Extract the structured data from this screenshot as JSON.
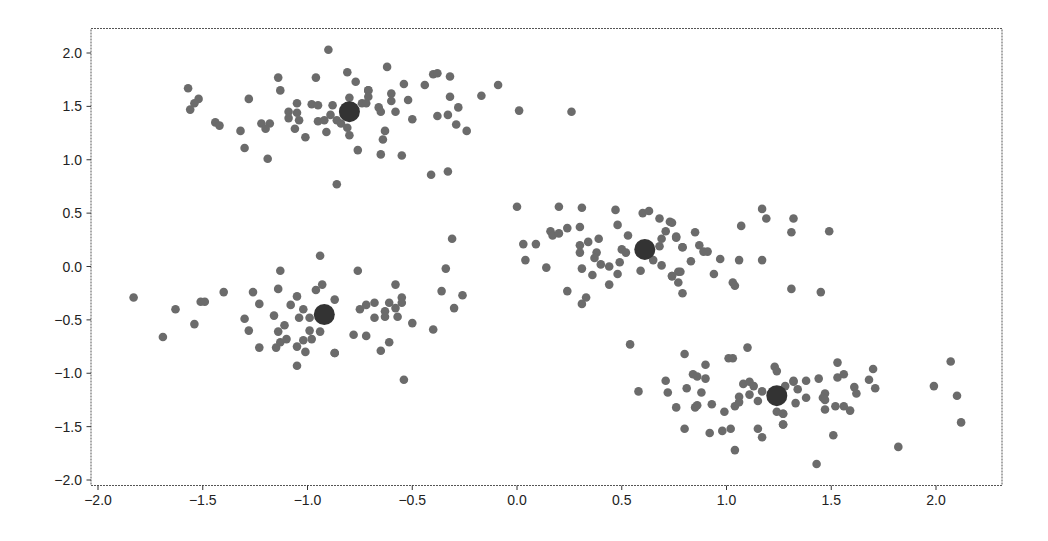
{
  "chart_data": {
    "type": "scatter",
    "title": "",
    "xlabel": "",
    "ylabel": "",
    "xlim": [
      -2.2,
      2.35
    ],
    "ylim": [
      -2.05,
      2.3
    ],
    "grid": false,
    "legend": null,
    "x_ticks": [
      -2.0,
      -1.5,
      -1.0,
      -0.5,
      0.0,
      0.5,
      1.0,
      1.5,
      2.0
    ],
    "x_tick_labels": [
      "−2.0",
      "−1.5",
      "−1.0",
      "−0.5",
      "0.0",
      "0.5",
      "1.0",
      "1.5",
      "2.0"
    ],
    "y_ticks": [
      2.0,
      1.5,
      1.0,
      0.5,
      0.0,
      -0.5,
      -1.0,
      -1.5,
      -2.0
    ],
    "y_tick_labels": [
      "2.0",
      "1.5",
      "1.0",
      "0.5",
      "0.0",
      "−0.5",
      "−1.0",
      "−1.5",
      "−2.0"
    ],
    "colors": {
      "points": "#6b6b6b",
      "centroids": "#333333",
      "frame": "#555555",
      "text": "#222222"
    },
    "centroids": [
      {
        "x": -0.8,
        "y": 1.45
      },
      {
        "x": -0.92,
        "y": -0.45
      },
      {
        "x": 0.61,
        "y": 0.16
      },
      {
        "x": 1.24,
        "y": -1.21
      }
    ],
    "series": [
      {
        "name": "cluster-top-left",
        "points": [
          [
            -1.57,
            1.67
          ],
          [
            -1.52,
            1.57
          ],
          [
            -1.54,
            1.53
          ],
          [
            -1.56,
            1.47
          ],
          [
            -1.44,
            1.35
          ],
          [
            -1.42,
            1.32
          ],
          [
            -1.32,
            1.27
          ],
          [
            -1.3,
            1.11
          ],
          [
            -1.28,
            1.57
          ],
          [
            -1.22,
            1.34
          ],
          [
            -1.18,
            1.34
          ],
          [
            -1.2,
            1.29
          ],
          [
            -1.19,
            1.01
          ],
          [
            -1.14,
            1.77
          ],
          [
            -1.13,
            1.65
          ],
          [
            -1.09,
            1.45
          ],
          [
            -1.09,
            1.39
          ],
          [
            -1.05,
            1.53
          ],
          [
            -1.05,
            1.44
          ],
          [
            -1.04,
            1.37
          ],
          [
            -1.06,
            1.29
          ],
          [
            -1.01,
            1.21
          ],
          [
            -0.98,
            1.52
          ],
          [
            -0.95,
            1.51
          ],
          [
            -0.96,
            1.77
          ],
          [
            -0.95,
            1.36
          ],
          [
            -0.92,
            1.37
          ],
          [
            -0.91,
            1.26
          ],
          [
            -0.9,
            2.03
          ],
          [
            -0.88,
            1.51
          ],
          [
            -0.89,
            1.42
          ],
          [
            -0.86,
            1.37
          ],
          [
            -0.84,
            1.34
          ],
          [
            -0.81,
            1.82
          ],
          [
            -0.77,
            1.73
          ],
          [
            -0.8,
            1.58
          ],
          [
            -0.74,
            1.53
          ],
          [
            -0.81,
            1.3
          ],
          [
            -0.8,
            1.23
          ],
          [
            -0.76,
            1.09
          ],
          [
            -0.86,
            0.77
          ],
          [
            -0.71,
            1.65
          ],
          [
            -0.62,
            1.87
          ],
          [
            -0.71,
            1.65
          ],
          [
            -0.71,
            1.59
          ],
          [
            -0.72,
            1.53
          ],
          [
            -0.6,
            1.62
          ],
          [
            -0.6,
            1.55
          ],
          [
            -0.54,
            1.71
          ],
          [
            -0.52,
            1.56
          ],
          [
            -0.66,
            1.49
          ],
          [
            -0.65,
            1.45
          ],
          [
            -0.58,
            1.45
          ],
          [
            -0.5,
            1.38
          ],
          [
            -0.63,
            1.27
          ],
          [
            -0.64,
            1.19
          ],
          [
            -0.65,
            1.05
          ],
          [
            -0.55,
            1.04
          ],
          [
            -0.44,
            1.7
          ],
          [
            -0.4,
            1.8
          ],
          [
            -0.38,
            1.81
          ],
          [
            -0.32,
            1.78
          ],
          [
            -0.32,
            1.59
          ],
          [
            -0.28,
            1.49
          ],
          [
            -0.38,
            1.41
          ],
          [
            -0.33,
            1.42
          ],
          [
            -0.29,
            1.33
          ],
          [
            -0.24,
            1.27
          ],
          [
            -0.41,
            0.86
          ],
          [
            -0.33,
            0.89
          ],
          [
            -0.17,
            1.6
          ],
          [
            -0.09,
            1.7
          ],
          [
            0.01,
            1.46
          ],
          [
            0.26,
            1.45
          ]
        ]
      },
      {
        "name": "cluster-bottom-left",
        "points": [
          [
            -1.83,
            -0.29
          ],
          [
            -1.69,
            -0.66
          ],
          [
            -1.63,
            -0.4
          ],
          [
            -1.54,
            -0.54
          ],
          [
            -1.51,
            -0.33
          ],
          [
            -1.49,
            -0.33
          ],
          [
            -1.4,
            -0.24
          ],
          [
            -1.3,
            -0.49
          ],
          [
            -1.28,
            -0.6
          ],
          [
            -1.26,
            -0.24
          ],
          [
            -1.23,
            -0.35
          ],
          [
            -1.23,
            -0.76
          ],
          [
            -1.16,
            -0.46
          ],
          [
            -1.14,
            -0.21
          ],
          [
            -1.13,
            -0.04
          ],
          [
            -1.14,
            -0.61
          ],
          [
            -1.11,
            -0.55
          ],
          [
            -1.15,
            -0.76
          ],
          [
            -1.13,
            -0.71
          ],
          [
            -1.1,
            -0.68
          ],
          [
            -1.08,
            -0.36
          ],
          [
            -1.05,
            -0.28
          ],
          [
            -1.04,
            -0.48
          ],
          [
            -1.05,
            -0.75
          ],
          [
            -1.05,
            -0.93
          ],
          [
            -1.02,
            -0.69
          ],
          [
            -1.02,
            -0.4
          ],
          [
            -1.01,
            -0.8
          ],
          [
            -0.99,
            -0.48
          ],
          [
            -0.99,
            -0.6
          ],
          [
            -0.98,
            -0.68
          ],
          [
            -0.96,
            -0.22
          ],
          [
            -0.93,
            -0.17
          ],
          [
            -0.94,
            0.1
          ],
          [
            -0.94,
            -0.61
          ],
          [
            -0.87,
            -0.31
          ],
          [
            -0.87,
            -0.81
          ],
          [
            -0.76,
            -0.04
          ],
          [
            -0.87,
            -0.81
          ],
          [
            -0.78,
            -0.64
          ],
          [
            -0.72,
            -0.65
          ],
          [
            -0.75,
            -0.4
          ],
          [
            -0.72,
            -0.36
          ],
          [
            -0.68,
            -0.34
          ],
          [
            -0.68,
            -0.48
          ],
          [
            -0.63,
            -0.42
          ],
          [
            -0.63,
            -0.47
          ],
          [
            -0.61,
            -0.34
          ],
          [
            -0.58,
            -0.17
          ],
          [
            -0.58,
            -0.39
          ],
          [
            -0.57,
            -0.47
          ],
          [
            -0.55,
            -0.29
          ],
          [
            -0.55,
            -0.34
          ],
          [
            -0.61,
            -0.71
          ],
          [
            -0.65,
            -0.79
          ],
          [
            -0.5,
            -0.53
          ],
          [
            -0.54,
            -1.06
          ],
          [
            -0.4,
            -0.59
          ],
          [
            -0.36,
            -0.23
          ],
          [
            -0.34,
            -0.02
          ],
          [
            -0.31,
            0.26
          ],
          [
            -0.26,
            -0.27
          ],
          [
            -0.3,
            -0.39
          ]
        ]
      },
      {
        "name": "cluster-middle",
        "points": [
          [
            0.0,
            0.56
          ],
          [
            0.2,
            0.56
          ],
          [
            0.31,
            0.55
          ],
          [
            0.47,
            0.53
          ],
          [
            0.6,
            0.5
          ],
          [
            0.63,
            0.52
          ],
          [
            0.68,
            0.45
          ],
          [
            0.73,
            0.42
          ],
          [
            0.48,
            0.39
          ],
          [
            0.3,
            0.37
          ],
          [
            0.24,
            0.36
          ],
          [
            0.16,
            0.33
          ],
          [
            0.17,
            0.29
          ],
          [
            0.2,
            0.31
          ],
          [
            0.71,
            0.33
          ],
          [
            0.53,
            0.29
          ],
          [
            0.76,
            0.28
          ],
          [
            0.69,
            0.26
          ],
          [
            0.39,
            0.26
          ],
          [
            0.34,
            0.23
          ],
          [
            0.3,
            0.2
          ],
          [
            0.03,
            0.21
          ],
          [
            0.09,
            0.21
          ],
          [
            0.79,
            0.18
          ],
          [
            0.68,
            0.19
          ],
          [
            0.5,
            0.16
          ],
          [
            0.52,
            0.13
          ],
          [
            0.3,
            0.13
          ],
          [
            0.38,
            0.13
          ],
          [
            0.37,
            0.08
          ],
          [
            0.04,
            0.06
          ],
          [
            0.65,
            0.06
          ],
          [
            0.49,
            0.04
          ],
          [
            0.4,
            0.02
          ],
          [
            0.44,
            0.0
          ],
          [
            0.69,
            0.01
          ],
          [
            0.14,
            -0.01
          ],
          [
            0.31,
            -0.02
          ],
          [
            0.59,
            -0.04
          ],
          [
            0.48,
            -0.07
          ],
          [
            0.36,
            -0.08
          ],
          [
            0.77,
            -0.05
          ],
          [
            0.74,
            -0.09
          ],
          [
            0.77,
            -0.15
          ],
          [
            0.44,
            -0.17
          ],
          [
            0.79,
            -0.25
          ],
          [
            0.24,
            -0.23
          ],
          [
            0.33,
            -0.29
          ],
          [
            0.31,
            -0.35
          ],
          [
            0.74,
            0.41
          ],
          [
            0.85,
            0.32
          ],
          [
            0.76,
            0.27
          ],
          [
            0.79,
            0.18
          ],
          [
            0.87,
            0.2
          ],
          [
            0.89,
            0.14
          ],
          [
            0.91,
            0.14
          ],
          [
            0.83,
            0.05
          ],
          [
            0.97,
            0.07
          ],
          [
            1.07,
            0.38
          ],
          [
            1.17,
            0.54
          ],
          [
            1.19,
            0.45
          ],
          [
            1.06,
            0.06
          ],
          [
            1.17,
            0.06
          ],
          [
            1.32,
            0.45
          ],
          [
            1.31,
            0.32
          ],
          [
            1.49,
            0.33
          ],
          [
            0.78,
            -0.05
          ],
          [
            0.74,
            -0.09
          ],
          [
            0.94,
            -0.07
          ],
          [
            1.03,
            -0.15
          ],
          [
            1.04,
            -0.18
          ],
          [
            1.31,
            -0.21
          ],
          [
            1.45,
            -0.24
          ]
        ]
      },
      {
        "name": "cluster-bottom-right",
        "points": [
          [
            0.54,
            -0.73
          ],
          [
            0.58,
            -1.17
          ],
          [
            0.71,
            -1.07
          ],
          [
            0.72,
            -1.18
          ],
          [
            0.76,
            -1.32
          ],
          [
            0.8,
            -1.52
          ],
          [
            0.8,
            -0.82
          ],
          [
            0.81,
            -1.14
          ],
          [
            0.84,
            -1.01
          ],
          [
            0.86,
            -1.03
          ],
          [
            0.85,
            -1.32
          ],
          [
            0.86,
            -1.3
          ],
          [
            0.88,
            -1.18
          ],
          [
            0.9,
            -0.92
          ],
          [
            0.9,
            -1.05
          ],
          [
            0.92,
            -1.56
          ],
          [
            0.93,
            -1.29
          ],
          [
            0.99,
            -1.36
          ],
          [
            0.98,
            -1.54
          ],
          [
            1.02,
            -1.52
          ],
          [
            1.01,
            -0.86
          ],
          [
            1.03,
            -0.86
          ],
          [
            1.04,
            -1.72
          ],
          [
            1.04,
            -1.31
          ],
          [
            1.06,
            -1.22
          ],
          [
            1.06,
            -1.27
          ],
          [
            1.08,
            -1.1
          ],
          [
            1.11,
            -1.08
          ],
          [
            1.11,
            -1.2
          ],
          [
            1.13,
            -1.12
          ],
          [
            1.1,
            -0.76
          ],
          [
            1.15,
            -1.26
          ],
          [
            1.15,
            -1.52
          ],
          [
            1.17,
            -1.6
          ],
          [
            1.17,
            -1.17
          ],
          [
            1.23,
            -0.94
          ],
          [
            1.24,
            -0.98
          ],
          [
            1.24,
            -1.36
          ],
          [
            1.27,
            -1.38
          ],
          [
            1.27,
            -1.48
          ],
          [
            1.28,
            -1.12
          ],
          [
            1.32,
            -1.07
          ],
          [
            1.53,
            -0.9
          ],
          [
            1.32,
            -1.08
          ],
          [
            1.34,
            -1.15
          ],
          [
            1.38,
            -1.07
          ],
          [
            1.44,
            -1.05
          ],
          [
            1.33,
            -1.28
          ],
          [
            1.38,
            -1.23
          ],
          [
            1.27,
            -1.38
          ],
          [
            1.27,
            -1.48
          ],
          [
            1.53,
            -1.04
          ],
          [
            1.56,
            -1.01
          ],
          [
            1.7,
            -0.96
          ],
          [
            1.68,
            -1.06
          ],
          [
            1.71,
            -1.14
          ],
          [
            1.61,
            -1.13
          ],
          [
            1.62,
            -1.19
          ],
          [
            1.47,
            -1.19
          ],
          [
            1.46,
            -1.23
          ],
          [
            1.47,
            -1.25
          ],
          [
            1.47,
            -1.34
          ],
          [
            1.52,
            -1.31
          ],
          [
            1.56,
            -1.31
          ],
          [
            1.59,
            -1.35
          ],
          [
            1.51,
            -1.58
          ],
          [
            1.82,
            -1.69
          ],
          [
            1.43,
            -1.85
          ],
          [
            2.07,
            -0.89
          ],
          [
            1.99,
            -1.12
          ],
          [
            2.1,
            -1.21
          ],
          [
            2.12,
            -1.46
          ]
        ]
      }
    ]
  }
}
